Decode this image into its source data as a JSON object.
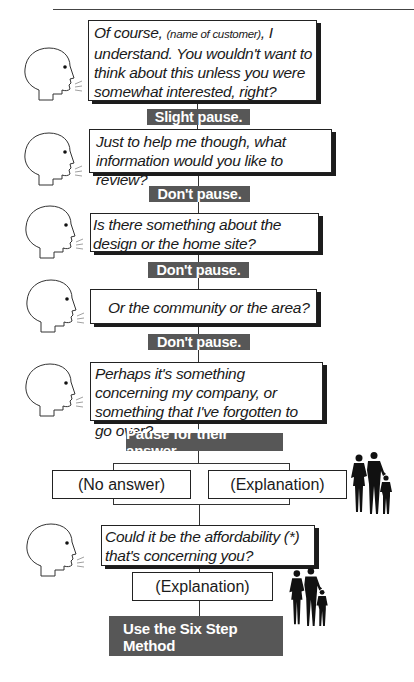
{
  "diagram": {
    "type": "script-flowchart",
    "steps": [
      {
        "speaker": "salesperson",
        "text_parts": [
          {
            "text": "Of course, ",
            "style": "normal"
          },
          {
            "text": "(name of customer)",
            "style": "small"
          },
          {
            "text": ", I understand. You wouldn't want to think about this unless you were somewhat interested, right?",
            "style": "normal"
          }
        ],
        "transition": "Slight pause."
      },
      {
        "speaker": "salesperson",
        "text": "Just to help me though, what information would you like to review?",
        "transition": "Don't pause."
      },
      {
        "speaker": "salesperson",
        "text": "Is there something about the design or the home site?",
        "transition": "Don't pause."
      },
      {
        "speaker": "salesperson",
        "text": "Or the community or the area?",
        "transition": "Don't pause."
      },
      {
        "speaker": "salesperson",
        "text": "Perhaps it's something concerning my company, or something that I've forgotten to go over?",
        "transition": "Pause for their answer."
      }
    ],
    "branches": [
      {
        "label": "(No answer)"
      },
      {
        "label": "(Explanation)",
        "speaker": "customers"
      }
    ],
    "followup": {
      "speaker": "salesperson",
      "text": "Could it be the affordability (*) that's concerning you?",
      "response": "(Explanation)",
      "response_speaker": "customers"
    },
    "final_action": {
      "line1": "Use the Six Step Method",
      "line2": "to handle objections."
    },
    "icons": {
      "speaker_icon": "speaking-head-icon",
      "customer_icon": "family-silhouette-icon"
    },
    "colors": {
      "label_bg": "#575757",
      "label_text": "#ffffff",
      "box_border": "#222222",
      "box_shadow": "#1c1c1c"
    }
  }
}
